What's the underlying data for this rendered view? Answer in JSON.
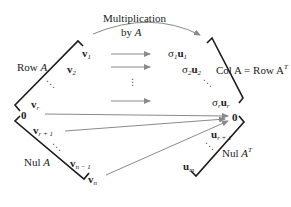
{
  "diagram": {
    "title_line1": "Multiplication",
    "title_line2_prefix": "by ",
    "title_line2_var": "A",
    "left_space": {
      "row_label_prefix": "Row ",
      "row_label_var": "A",
      "nul_label_prefix": "Nul ",
      "nul_label_var": "A",
      "vectors": [
        {
          "base": "v",
          "sub": "1"
        },
        {
          "base": "v",
          "sub": "2"
        },
        {
          "base": "v",
          "sub": "r"
        },
        {
          "base": "v",
          "sub": "r + 1"
        },
        {
          "base": "v",
          "sub": "n − 1"
        },
        {
          "base": "v",
          "sub": "n"
        }
      ],
      "zero": "0"
    },
    "right_space": {
      "col_label": "Col A = Row A",
      "col_label_sup": "T",
      "nul_label_prefix": "Nul ",
      "nul_label_var": "A",
      "nul_label_sup": "T",
      "vectors": [
        {
          "coef": "σ",
          "coef_sub": "1",
          "base": "u",
          "sub": "1"
        },
        {
          "coef": "σ",
          "coef_sub": "2",
          "base": "u",
          "sub": "2"
        },
        {
          "coef": "σ",
          "coef_sub": "r",
          "base": "u",
          "sub": "r"
        },
        {
          "base": "u",
          "sub": "r + 1"
        },
        {
          "base": "u",
          "sub": "m"
        }
      ],
      "zero": "0"
    },
    "ellipsis_diag": "⋱",
    "ellipsis_vert": "⋮",
    "colors": {
      "bracket": "#1a1a1a",
      "arrow": "#8a8a8a",
      "text": "#222222"
    }
  }
}
